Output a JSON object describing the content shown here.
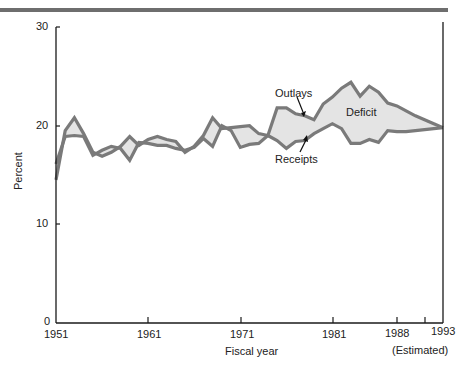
{
  "chart_data": {
    "type": "area",
    "title": "",
    "xlabel": "Fiscal year",
    "ylabel": "Percent",
    "ylim": [
      0,
      30
    ],
    "xlim": [
      1951,
      1993
    ],
    "yticks": [
      "0",
      "10",
      "20",
      "30"
    ],
    "xticks": [
      "1951",
      "1961",
      "1971",
      "1981",
      "1988",
      "1993"
    ],
    "xnote": "(Estimated)",
    "grid": false,
    "annotations": [
      "Outlays",
      "Receipts",
      "Deficit"
    ],
    "x": [
      1951,
      1952,
      1953,
      1954,
      1955,
      1956,
      1957,
      1958,
      1959,
      1960,
      1961,
      1962,
      1963,
      1964,
      1965,
      1966,
      1967,
      1968,
      1969,
      1970,
      1971,
      1972,
      1973,
      1974,
      1975,
      1976,
      1977,
      1978,
      1979,
      1980,
      1981,
      1982,
      1983,
      1984,
      1985,
      1986,
      1987,
      1988,
      1989,
      1990,
      1991,
      1992,
      1993
    ],
    "series": [
      {
        "name": "Outlays",
        "values": [
          14.5,
          19.5,
          20.8,
          19.2,
          17.3,
          16.9,
          17.3,
          17.9,
          18.9,
          18.0,
          18.6,
          18.9,
          18.6,
          18.4,
          17.3,
          17.9,
          19.0,
          20.8,
          19.7,
          19.8,
          19.9,
          20.0,
          19.2,
          19.0,
          21.8,
          21.8,
          21.2,
          21.0,
          20.6,
          22.2,
          22.9,
          23.8,
          24.4,
          23.0,
          24.0,
          23.4,
          22.3,
          22.0,
          21.5,
          21.0,
          20.6,
          20.2,
          19.8
        ]
      },
      {
        "name": "Receipts",
        "values": [
          16.1,
          18.9,
          19.0,
          18.9,
          17.0,
          17.5,
          17.9,
          17.7,
          16.5,
          18.3,
          18.2,
          18.0,
          18.0,
          17.7,
          17.5,
          17.8,
          18.7,
          17.9,
          20.0,
          19.5,
          17.8,
          18.1,
          18.2,
          19.0,
          18.5,
          17.7,
          18.4,
          18.5,
          19.2,
          19.7,
          20.2,
          19.7,
          18.2,
          18.2,
          18.6,
          18.3,
          19.5,
          19.4,
          19.4,
          19.5,
          19.6,
          19.7,
          19.8
        ]
      }
    ],
    "colors": {
      "line": "#7a7a7a",
      "fill": "#e4e4e4",
      "axis": "#1a1a1a"
    }
  },
  "labels": {
    "y0": "0",
    "y10": "10",
    "y20": "20",
    "y30": "30",
    "x1951": "1951",
    "x1961": "1961",
    "x1971": "1971",
    "x1981": "1981",
    "x1988": "1988",
    "x1993": "1993",
    "xlabel": "Fiscal year",
    "ylabel": "Percent",
    "estimated": "(Estimated)",
    "outlays": "Outlays",
    "receipts": "Receipts",
    "deficit": "Deficit"
  }
}
